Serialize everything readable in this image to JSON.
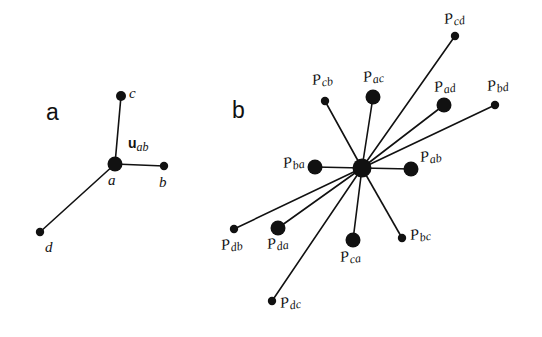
{
  "figure": {
    "width": 542,
    "height": 337,
    "background": "#ffffff",
    "ink_color": "#111111"
  },
  "panels": [
    {
      "id": "a",
      "label": "a",
      "label_x": 46,
      "label_y": 101,
      "hub": {
        "name": "a",
        "x": 115,
        "y": 164,
        "r": 7.5
      },
      "hub_label": {
        "text": "a",
        "x": 108,
        "y": 173
      },
      "nodes": [
        {
          "name": "c",
          "label": "c",
          "x": 121,
          "y": 96,
          "r": 5.0,
          "label_x": 129,
          "label_y": 86
        },
        {
          "name": "b",
          "label": "b",
          "x": 164,
          "y": 166,
          "r": 4.2,
          "label_x": 159,
          "label_y": 175
        },
        {
          "name": "d",
          "label": "d",
          "x": 40,
          "y": 232,
          "r": 4.2,
          "label_x": 45,
          "label_y": 240
        }
      ],
      "vector_label": {
        "head": "u",
        "sub": "ab",
        "x": 128,
        "y": 136
      }
    },
    {
      "id": "b",
      "label": "b",
      "label_x": 232,
      "label_y": 99,
      "hub": {
        "name": "hub",
        "x": 362,
        "y": 168,
        "r": 9.5
      },
      "nodes": [
        {
          "name": "P_cd",
          "base": "P",
          "sub": "cd",
          "x": 455,
          "y": 36,
          "r": 4.2,
          "label_x": 444,
          "label_y": 12
        },
        {
          "name": "P_cb",
          "base": "P",
          "sub": "cb",
          "x": 325,
          "y": 101,
          "r": 4.2,
          "label_x": 312,
          "label_y": 73
        },
        {
          "name": "P_ac",
          "base": "P",
          "sub": "ac",
          "x": 373,
          "y": 97,
          "r": 7.5,
          "label_x": 363,
          "label_y": 70
        },
        {
          "name": "P_ad",
          "base": "P",
          "sub": "ad",
          "x": 444,
          "y": 105,
          "r": 7.5,
          "label_x": 434,
          "label_y": 80
        },
        {
          "name": "P_bd",
          "base": "P",
          "sub": "bd",
          "x": 495,
          "y": 105,
          "r": 4.2,
          "label_x": 487,
          "label_y": 79
        },
        {
          "name": "P_ab",
          "base": "P",
          "sub": "ab",
          "x": 411,
          "y": 169,
          "r": 7.5,
          "label_x": 420,
          "label_y": 150
        },
        {
          "name": "P_ba",
          "base": "P",
          "sub": "ba",
          "x": 315,
          "y": 167,
          "r": 7.5,
          "label_x": 283,
          "label_y": 156
        },
        {
          "name": "P_bc",
          "base": "P",
          "sub": "bc",
          "x": 402,
          "y": 238,
          "r": 4.2,
          "label_x": 410,
          "label_y": 228
        },
        {
          "name": "P_ca",
          "base": "P",
          "sub": "ca",
          "x": 353,
          "y": 240,
          "r": 7.5,
          "label_x": 340,
          "label_y": 250
        },
        {
          "name": "P_da",
          "base": "P",
          "sub": "da",
          "x": 278,
          "y": 228,
          "r": 7.5,
          "label_x": 267,
          "label_y": 237
        },
        {
          "name": "P_db",
          "base": "P",
          "sub": "db",
          "x": 234,
          "y": 229,
          "r": 4.2,
          "label_x": 221,
          "label_y": 238
        },
        {
          "name": "P_dc",
          "base": "P",
          "sub": "dc",
          "x": 272,
          "y": 301,
          "r": 4.2,
          "label_x": 280,
          "label_y": 296
        }
      ]
    }
  ],
  "style": {
    "edge_width": 1.6,
    "edge_color": "#111111"
  }
}
